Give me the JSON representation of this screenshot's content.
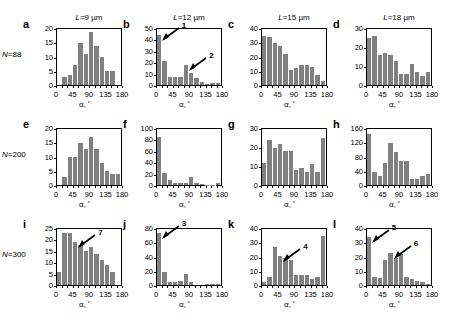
{
  "figure": {
    "column_headers": [
      {
        "prefix": "L",
        "value": "=9 µm"
      },
      {
        "prefix": "L",
        "value": "=12 µm"
      },
      {
        "prefix": "L",
        "value": "=15 µm"
      },
      {
        "prefix": "L",
        "value": "=18 µm"
      }
    ],
    "row_labels": [
      {
        "prefix": "N",
        "value": "=88"
      },
      {
        "prefix": "N",
        "value": "=200"
      },
      {
        "prefix": "N",
        "value": "=300"
      }
    ],
    "xaxis_label": "α,",
    "xaxis_degree": "°",
    "bar_color": "#808080",
    "axis_color": "#000000"
  },
  "chart_data": [
    {
      "type": "bar",
      "panel": "a",
      "title": "L=9 µm, N=88",
      "xlabel": "α, °",
      "ylabel": "",
      "xlim": [
        0,
        180
      ],
      "ylim": [
        0,
        20
      ],
      "yticks": [
        0,
        5,
        10,
        15,
        20
      ],
      "xticks": [
        0,
        45,
        90,
        135,
        180
      ],
      "bin_width": 15,
      "categories": [
        "0-15",
        "15-30",
        "30-45",
        "45-60",
        "60-75",
        "75-90",
        "90-105",
        "105-120",
        "120-135",
        "135-150",
        "150-165",
        "165-180"
      ],
      "values": [
        0,
        3,
        3.5,
        7,
        15,
        11,
        19,
        14,
        10,
        5,
        5,
        0
      ],
      "annotations": []
    },
    {
      "type": "bar",
      "panel": "b",
      "title": "L=12 µm, N=88",
      "xlabel": "α, °",
      "ylabel": "",
      "xlim": [
        0,
        180
      ],
      "ylim": [
        0,
        50
      ],
      "yticks": [
        0,
        10,
        20,
        30,
        40,
        50
      ],
      "xticks": [
        0,
        45,
        90,
        135,
        180
      ],
      "bin_width": 15,
      "categories": [
        "0-15",
        "15-30",
        "30-45",
        "45-60",
        "60-75",
        "75-90",
        "90-105",
        "105-120",
        "120-135",
        "135-150",
        "150-165",
        "165-180"
      ],
      "values": [
        45,
        21,
        7,
        7,
        7,
        18,
        11,
        6,
        3,
        1,
        1.5,
        1.5
      ],
      "annotations": [
        {
          "label": "1",
          "target_bin": 0
        },
        {
          "label": "2",
          "target_bin": 5
        }
      ]
    },
    {
      "type": "bar",
      "panel": "c",
      "title": "L=15 µm, N=88",
      "xlabel": "α, °",
      "ylabel": "",
      "xlim": [
        0,
        180
      ],
      "ylim": [
        0,
        40
      ],
      "yticks": [
        0,
        10,
        20,
        30,
        40
      ],
      "xticks": [
        0,
        45,
        90,
        135,
        180
      ],
      "bin_width": 15,
      "categories": [
        "0-15",
        "15-30",
        "30-45",
        "45-60",
        "60-75",
        "75-90",
        "90-105",
        "105-120",
        "120-135",
        "135-150",
        "150-165",
        "165-180"
      ],
      "values": [
        35,
        34,
        30,
        28,
        22,
        11,
        12,
        14,
        14,
        13,
        7,
        3
      ],
      "annotations": []
    },
    {
      "type": "bar",
      "panel": "d",
      "title": "L=18 µm, N=88",
      "xlabel": "α, °",
      "ylabel": "",
      "xlim": [
        0,
        180
      ],
      "ylim": [
        0,
        30
      ],
      "yticks": [
        0,
        10,
        20,
        30
      ],
      "xticks": [
        0,
        45,
        90,
        135,
        180
      ],
      "bin_width": 15,
      "categories": [
        "0-15",
        "15-30",
        "30-45",
        "45-60",
        "60-75",
        "75-90",
        "90-105",
        "105-120",
        "120-135",
        "135-150",
        "150-165",
        "165-180"
      ],
      "values": [
        25,
        26,
        16,
        17,
        16,
        13,
        6,
        6,
        11,
        7,
        5,
        7
      ],
      "annotations": []
    },
    {
      "type": "bar",
      "panel": "e",
      "title": "L=9 µm, N=200",
      "xlabel": "α, °",
      "ylabel": "",
      "xlim": [
        0,
        180
      ],
      "ylim": [
        0,
        20
      ],
      "yticks": [
        0,
        5,
        10,
        15,
        20
      ],
      "xticks": [
        0,
        45,
        90,
        135,
        180
      ],
      "bin_width": 15,
      "categories": [
        "0-15",
        "15-30",
        "30-45",
        "45-60",
        "60-75",
        "75-90",
        "90-105",
        "105-120",
        "120-135",
        "135-150",
        "150-165",
        "165-180"
      ],
      "values": [
        0,
        3,
        10,
        10,
        15,
        13,
        17,
        13,
        8,
        5,
        4,
        4
      ],
      "annotations": []
    },
    {
      "type": "bar",
      "panel": "f",
      "title": "L=12 µm, N=200",
      "xlabel": "α, °",
      "ylabel": "",
      "xlim": [
        0,
        180
      ],
      "ylim": [
        0,
        100
      ],
      "yticks": [
        0,
        20,
        40,
        60,
        80,
        100
      ],
      "xticks": [
        0,
        45,
        90,
        135,
        180
      ],
      "bin_width": 15,
      "categories": [
        "0-15",
        "15-30",
        "30-45",
        "45-60",
        "60-75",
        "75-90",
        "90-105",
        "105-120",
        "120-135",
        "135-150",
        "150-165",
        "165-180"
      ],
      "values": [
        85,
        21,
        9,
        3,
        3,
        4,
        14,
        3,
        1,
        0.5,
        0.5,
        3
      ],
      "annotations": []
    },
    {
      "type": "bar",
      "panel": "g",
      "title": "L=15 µm, N=200",
      "xlabel": "α, °",
      "ylabel": "",
      "xlim": [
        0,
        180
      ],
      "ylim": [
        0,
        30
      ],
      "yticks": [
        0,
        10,
        20,
        30
      ],
      "xticks": [
        0,
        45,
        90,
        135,
        180
      ],
      "bin_width": 15,
      "categories": [
        "0-15",
        "15-30",
        "30-45",
        "45-60",
        "60-75",
        "75-90",
        "90-105",
        "105-120",
        "120-135",
        "135-150",
        "150-165",
        "165-180"
      ],
      "values": [
        12,
        24,
        20,
        22,
        18,
        18,
        8,
        9,
        7,
        11,
        7,
        25
      ],
      "annotations": []
    },
    {
      "type": "bar",
      "panel": "h",
      "title": "L=18 µm, N=200",
      "xlabel": "α, °",
      "ylabel": "",
      "xlim": [
        0,
        180
      ],
      "ylim": [
        0,
        160
      ],
      "yticks": [
        0,
        40,
        80,
        120,
        160
      ],
      "xticks": [
        0,
        45,
        90,
        135,
        180
      ],
      "bin_width": 15,
      "categories": [
        "0-15",
        "15-30",
        "30-45",
        "45-60",
        "60-75",
        "75-90",
        "90-105",
        "105-120",
        "120-135",
        "135-150",
        "150-165",
        "165-180"
      ],
      "values": [
        145,
        38,
        25,
        62,
        119,
        95,
        70,
        68,
        18,
        18,
        25,
        32
      ],
      "annotations": []
    },
    {
      "type": "bar",
      "panel": "i",
      "title": "L=9 µm, N=300",
      "xlabel": "α, °",
      "ylabel": "",
      "xlim": [
        0,
        180
      ],
      "ylim": [
        0,
        25
      ],
      "yticks": [
        0,
        5,
        10,
        15,
        20,
        25
      ],
      "xticks": [
        0,
        45,
        90,
        135,
        180
      ],
      "bin_width": 15,
      "categories": [
        "0-15",
        "15-30",
        "30-45",
        "45-60",
        "60-75",
        "75-90",
        "90-105",
        "105-120",
        "120-135",
        "135-150",
        "150-165",
        "165-180"
      ],
      "values": [
        6,
        23,
        23,
        19,
        18,
        15,
        17,
        14,
        11,
        9,
        6,
        0
      ],
      "annotations": [
        {
          "label": "7",
          "target_bin": 3
        }
      ]
    },
    {
      "type": "bar",
      "panel": "j",
      "title": "L=12 µm, N=300",
      "xlabel": "α, °",
      "ylabel": "",
      "xlim": [
        0,
        180
      ],
      "ylim": [
        0,
        80
      ],
      "yticks": [
        0,
        20,
        40,
        60,
        80
      ],
      "xticks": [
        0,
        45,
        90,
        135,
        180
      ],
      "bin_width": 15,
      "categories": [
        "0-15",
        "15-30",
        "30-45",
        "45-60",
        "60-75",
        "75-90",
        "90-105",
        "105-120",
        "120-135",
        "135-150",
        "150-165",
        "165-180"
      ],
      "values": [
        75,
        19,
        4,
        4,
        6,
        16,
        4,
        0,
        0,
        1.5,
        1.5,
        1
      ],
      "annotations": [
        {
          "label": "3",
          "target_bin": 0
        }
      ]
    },
    {
      "type": "bar",
      "panel": "k",
      "title": "L=15 µm, N=300",
      "xlabel": "α, °",
      "ylabel": "",
      "xlim": [
        0,
        180
      ],
      "ylim": [
        0,
        40
      ],
      "yticks": [
        0,
        10,
        20,
        30,
        40
      ],
      "xticks": [
        0,
        45,
        90,
        135,
        180
      ],
      "bin_width": 15,
      "categories": [
        "0-15",
        "15-30",
        "30-45",
        "45-60",
        "60-75",
        "75-90",
        "90-105",
        "105-120",
        "120-135",
        "135-150",
        "150-165",
        "165-180"
      ],
      "values": [
        2.5,
        6,
        27,
        21,
        19,
        18,
        7,
        7,
        7,
        4.5,
        6,
        35
      ],
      "annotations": [
        {
          "label": "4",
          "target_bin": 3
        }
      ]
    },
    {
      "type": "bar",
      "panel": "l",
      "title": "L=18 µm, N=300",
      "xlabel": "α, °",
      "ylabel": "",
      "xlim": [
        0,
        180
      ],
      "ylim": [
        0,
        40
      ],
      "yticks": [
        0,
        10,
        20,
        30,
        40
      ],
      "xticks": [
        0,
        45,
        90,
        135,
        180
      ],
      "bin_width": 15,
      "categories": [
        "0-15",
        "15-30",
        "30-45",
        "45-60",
        "60-75",
        "75-90",
        "90-105",
        "105-120",
        "120-135",
        "135-150",
        "150-165",
        "165-180"
      ],
      "values": [
        34,
        6,
        5,
        18,
        23,
        19,
        22,
        6,
        4,
        3,
        2,
        1
      ],
      "annotations": [
        {
          "label": "5",
          "target_bin": 0
        },
        {
          "label": "6",
          "target_bin": 4
        }
      ]
    }
  ],
  "panel_letters": [
    "a",
    "b",
    "c",
    "d",
    "e",
    "f",
    "g",
    "h",
    "i",
    "j",
    "k",
    "l"
  ]
}
